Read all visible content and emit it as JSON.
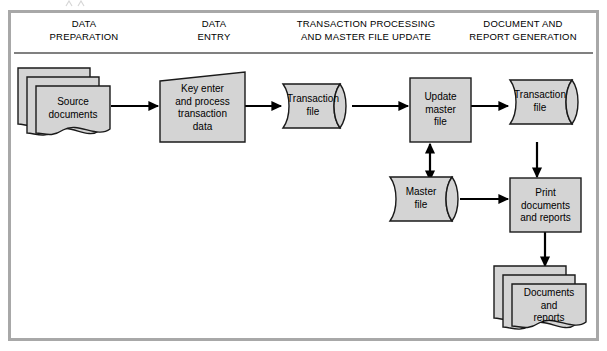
{
  "diagram": {
    "frame": {
      "border_color": "#a8a8a8",
      "background": "#ffffff"
    },
    "shape_style": {
      "fill": "#d4d4d4",
      "stroke": "#1a1a1a"
    },
    "columns": [
      {
        "id": "data-preparation",
        "label": "DATA\nPREPARATION"
      },
      {
        "id": "data-entry",
        "label": "DATA\nENTRY"
      },
      {
        "id": "transaction-processing",
        "label": "TRANSACTION PROCESSING\nAND MASTER FILE UPDATE"
      },
      {
        "id": "document-report-generation",
        "label": "DOCUMENT AND\nREPORT GENERATION"
      }
    ],
    "nodes": [
      {
        "id": "source-documents",
        "label": "Source\ndocuments",
        "shape": "document-stack",
        "column": "data-preparation"
      },
      {
        "id": "key-enter-process",
        "label": "Key enter\nand process\ntransaction\ndata",
        "shape": "manual-input",
        "column": "data-entry"
      },
      {
        "id": "transaction-file-1",
        "label": "Transaction\nfile",
        "shape": "stored-data",
        "column": "transaction-processing"
      },
      {
        "id": "update-master-file",
        "label": "Update\nmaster\nfile",
        "shape": "process",
        "column": "transaction-processing"
      },
      {
        "id": "master-file",
        "label": "Master\nfile",
        "shape": "stored-data",
        "column": "transaction-processing"
      },
      {
        "id": "transaction-file-2",
        "label": "Transaction\nfile",
        "shape": "stored-data",
        "column": "document-report-generation"
      },
      {
        "id": "print-documents-reports",
        "label": "Print\ndocuments\nand reports",
        "shape": "process",
        "column": "document-report-generation"
      },
      {
        "id": "documents-and-reports",
        "label": "Documents\nand\nreports",
        "shape": "document-stack",
        "column": "document-report-generation"
      }
    ],
    "connectors": [
      {
        "id": "source-to-keyenter",
        "from": "source-documents",
        "to": "key-enter-process",
        "direction": "single",
        "orientation": "horizontal"
      },
      {
        "id": "keyenter-to-transaction1",
        "from": "key-enter-process",
        "to": "transaction-file-1",
        "direction": "single",
        "orientation": "horizontal"
      },
      {
        "id": "transaction1-to-update",
        "from": "transaction-file-1",
        "to": "update-master-file",
        "direction": "single",
        "orientation": "horizontal"
      },
      {
        "id": "update-to-transaction2",
        "from": "update-master-file",
        "to": "transaction-file-2",
        "direction": "single",
        "orientation": "horizontal"
      },
      {
        "id": "update-masterfile-bidirectional",
        "from": "update-master-file",
        "to": "master-file",
        "direction": "double",
        "orientation": "vertical"
      },
      {
        "id": "masterfile-to-print",
        "from": "master-file",
        "to": "print-documents-reports",
        "direction": "single",
        "orientation": "horizontal"
      },
      {
        "id": "transaction2-to-print",
        "from": "transaction-file-2",
        "to": "print-documents-reports",
        "direction": "single",
        "orientation": "vertical"
      },
      {
        "id": "print-to-documents",
        "from": "print-documents-reports",
        "to": "documents-and-reports",
        "direction": "single",
        "orientation": "vertical"
      }
    ]
  }
}
